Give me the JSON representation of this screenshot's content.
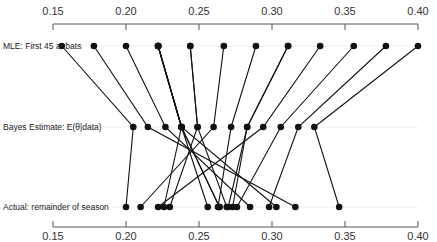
{
  "chart_data": {
    "type": "line",
    "title": "",
    "xlabel": "",
    "ylabel": "",
    "xlim": [
      0.15,
      0.4
    ],
    "ticks": [
      0.15,
      0.2,
      0.25,
      0.3,
      0.35,
      0.4
    ],
    "tick_labels": [
      "0.15",
      "0.20",
      "0.25",
      "0.30",
      "0.35",
      "0.40"
    ],
    "axes": [
      "top",
      "bottom"
    ],
    "rows": [
      {
        "name": "mle",
        "label": "MLE: First 45 at bats"
      },
      {
        "name": "bayes",
        "label": "Bayes Estimate: E(θ|data)"
      },
      {
        "name": "actual",
        "label": "Actual: remainder of season"
      }
    ],
    "series": [
      {
        "mle": 0.4,
        "bayes": 0.329,
        "actual": 0.346
      },
      {
        "mle": 0.378,
        "bayes": 0.318,
        "actual": 0.298
      },
      {
        "mle": 0.356,
        "bayes": 0.306,
        "actual": 0.276
      },
      {
        "mle": 0.333,
        "bayes": 0.294,
        "actual": 0.222
      },
      {
        "mle": 0.311,
        "bayes": 0.283,
        "actual": 0.273
      },
      {
        "mle": 0.311,
        "bayes": 0.283,
        "actual": 0.27
      },
      {
        "mle": 0.289,
        "bayes": 0.272,
        "actual": 0.263
      },
      {
        "mle": 0.267,
        "bayes": 0.26,
        "actual": 0.21
      },
      {
        "mle": 0.244,
        "bayes": 0.249,
        "actual": 0.269
      },
      {
        "mle": 0.244,
        "bayes": 0.249,
        "actual": 0.23
      },
      {
        "mle": 0.222,
        "bayes": 0.238,
        "actual": 0.264
      },
      {
        "mle": 0.222,
        "bayes": 0.238,
        "actual": 0.256
      },
      {
        "mle": 0.222,
        "bayes": 0.238,
        "actual": 0.303
      },
      {
        "mle": 0.222,
        "bayes": 0.238,
        "actual": 0.264
      },
      {
        "mle": 0.222,
        "bayes": 0.238,
        "actual": 0.226
      },
      {
        "mle": 0.2,
        "bayes": 0.227,
        "actual": 0.285
      },
      {
        "mle": 0.178,
        "bayes": 0.215,
        "actual": 0.316
      },
      {
        "mle": 0.156,
        "bayes": 0.205,
        "actual": 0.2
      }
    ]
  },
  "style": {
    "point_color": "#111111",
    "line_color": "#111111",
    "axis_color": "#555555",
    "grid_color": "#eeeeee"
  }
}
